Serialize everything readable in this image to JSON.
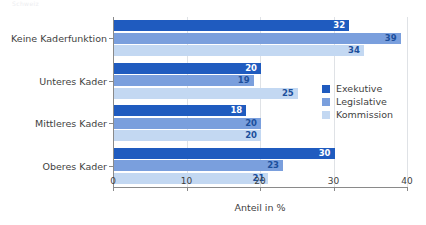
{
  "caption_remnant": "Schweiz",
  "chart_data": {
    "type": "bar",
    "orientation": "horizontal",
    "title": "",
    "subtitle": "",
    "xlabel": "Anteil in %",
    "ylabel": "",
    "xlim": [
      0,
      40
    ],
    "xticks": [
      0,
      10,
      20,
      30,
      40
    ],
    "xtick_labels": [
      "0",
      "10",
      "20",
      "30",
      "40"
    ],
    "grid": true,
    "grid_axis": "x",
    "legend_position": "center-right",
    "categories": [
      "Keine Kaderfunktion",
      "Unteres Kader",
      "Mittleres Kader",
      "Oberes Kader"
    ],
    "series": [
      {
        "name": "Exekutive",
        "color": "#1f5bbf",
        "label_color": "#ffffff",
        "values": [
          32,
          20,
          18,
          30
        ]
      },
      {
        "name": "Legislative",
        "color": "#7a9fdd",
        "label_color": "#1c4f9c",
        "values": [
          39,
          19,
          20,
          23
        ]
      },
      {
        "name": "Kommission",
        "color": "#c3d8f2",
        "label_color": "#1c4f9c",
        "values": [
          34,
          25,
          20,
          21
        ]
      }
    ]
  },
  "legend": {
    "items": [
      {
        "label": "Exekutive",
        "color": "#1f5bbf"
      },
      {
        "label": "Legislative",
        "color": "#7a9fdd"
      },
      {
        "label": "Kommission",
        "color": "#c3d8f2"
      }
    ]
  },
  "axis": {
    "x_title": "Anteil in %"
  }
}
